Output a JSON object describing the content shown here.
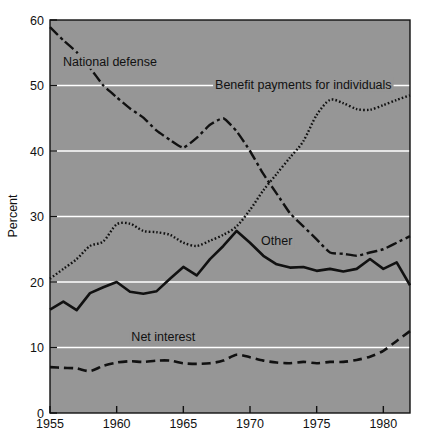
{
  "chart_data": {
    "type": "line",
    "title": "",
    "xlabel": "",
    "ylabel": "Percent",
    "xlim": [
      1955,
      1982
    ],
    "ylim": [
      0,
      60
    ],
    "grid": true,
    "legend_position": "inline-annotations",
    "background_color": "#969696",
    "gridline_color": "#ffffff",
    "line_color": "#111111",
    "x_ticks": [
      "1955",
      "1960",
      "1965",
      "1970",
      "1975",
      "1980"
    ],
    "x_tick_values": [
      1955,
      1960,
      1965,
      1970,
      1975,
      1980
    ],
    "y_ticks": [
      "0",
      "10",
      "20",
      "30",
      "40",
      "50",
      "60"
    ],
    "y_tick_values": [
      0,
      10,
      20,
      30,
      40,
      50,
      60
    ],
    "x": [
      1955,
      1956,
      1957,
      1958,
      1959,
      1960,
      1961,
      1962,
      1963,
      1964,
      1965,
      1966,
      1967,
      1968,
      1969,
      1970,
      1971,
      1972,
      1973,
      1974,
      1975,
      1976,
      1977,
      1978,
      1979,
      1980,
      1981,
      1982
    ],
    "series": [
      {
        "name": "National defense",
        "style": "dash-dot",
        "label_x": 1959.5,
        "label_y": 53.0,
        "values": [
          58.9,
          56.9,
          55.1,
          52.7,
          50.0,
          48.2,
          46.5,
          45.1,
          43.1,
          41.7,
          40.5,
          42.0,
          44.0,
          45.0,
          43.0,
          40.0,
          36.5,
          33.5,
          30.5,
          28.5,
          26.5,
          24.5,
          24.3,
          24.0,
          24.5,
          25.0,
          26.0,
          27.0
        ]
      },
      {
        "name": "Benefit payments for individuals",
        "style": "dotted",
        "label_x": 1974.0,
        "label_y": 49.5,
        "values": [
          20.5,
          22.0,
          23.5,
          25.5,
          26.2,
          28.8,
          28.9,
          27.8,
          27.6,
          27.2,
          26.0,
          25.5,
          26.3,
          27.2,
          28.5,
          31.0,
          34.0,
          36.5,
          39.0,
          41.5,
          45.5,
          47.8,
          47.3,
          46.4,
          46.3,
          47.0,
          47.8,
          48.5
        ]
      },
      {
        "name": "Other",
        "style": "solid",
        "label_x": 1972.0,
        "label_y": 25.6,
        "values": [
          15.8,
          17.0,
          15.7,
          18.3,
          19.2,
          20.0,
          18.5,
          18.2,
          18.6,
          20.5,
          22.3,
          21.0,
          23.5,
          25.5,
          27.8,
          26.0,
          24.0,
          22.7,
          22.2,
          22.3,
          21.7,
          22.0,
          21.6,
          22.0,
          23.5,
          22.0,
          23.0,
          19.5
        ]
      },
      {
        "name": "Net interest",
        "style": "dashed",
        "label_x": 1963.5,
        "label_y": 11.0,
        "values": [
          7.0,
          6.9,
          6.8,
          6.4,
          7.2,
          7.7,
          7.9,
          7.8,
          8.0,
          8.0,
          7.6,
          7.5,
          7.6,
          8.0,
          8.9,
          8.5,
          8.0,
          7.7,
          7.6,
          7.8,
          7.6,
          7.8,
          7.8,
          8.1,
          8.6,
          9.5,
          11.0,
          12.5
        ]
      }
    ]
  }
}
